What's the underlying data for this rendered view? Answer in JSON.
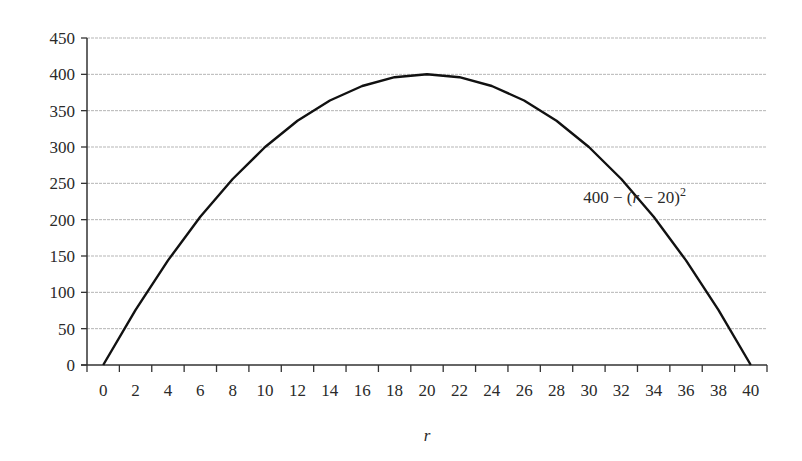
{
  "chart_data": {
    "type": "line",
    "title": "",
    "xlabel": "r",
    "ylabel": "",
    "annotation": {
      "text_main": "400 − (",
      "text_var": "r",
      "text_rest": " − 20)",
      "text_sup": "2",
      "x_category": 16,
      "y_value": 218
    },
    "x": [
      0,
      2,
      4,
      6,
      8,
      10,
      12,
      14,
      16,
      18,
      20,
      22,
      24,
      26,
      28,
      30,
      32,
      34,
      36,
      38,
      40
    ],
    "categories": [
      "0",
      "2",
      "4",
      "6",
      "8",
      "10",
      "12",
      "14",
      "16",
      "18",
      "20",
      "22",
      "24",
      "26",
      "28",
      "30",
      "32",
      "34",
      "36",
      "38",
      "40"
    ],
    "series": [
      {
        "name": "400 - (r - 20)^2",
        "color": "#111111",
        "values": [
          0,
          76,
          144,
          204,
          256,
          300,
          336,
          364,
          384,
          396,
          400,
          396,
          384,
          364,
          336,
          300,
          256,
          204,
          144,
          76,
          0
        ]
      }
    ],
    "yticks": [
      0,
      50,
      100,
      150,
      200,
      250,
      300,
      350,
      400,
      450
    ],
    "ylim": [
      0,
      450
    ],
    "grid": true,
    "legend": "none",
    "gridline_color": "#b5b5b5",
    "axis_color": "#333333"
  }
}
